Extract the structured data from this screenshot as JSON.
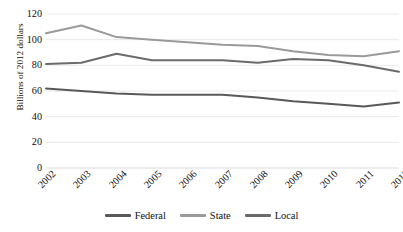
{
  "chart_data": {
    "type": "line",
    "title": "",
    "subtitle": "",
    "xlabel": "",
    "ylabel": "Billions of 2012 dollars",
    "categories": [
      "2002",
      "2003",
      "2004",
      "2005",
      "2006",
      "2007",
      "2008",
      "2009",
      "2010",
      "2011",
      "2012"
    ],
    "x": [
      2002,
      2003,
      2004,
      2005,
      2006,
      2007,
      2008,
      2009,
      2010,
      2011,
      2012
    ],
    "series": [
      {
        "name": "Federal",
        "color": "#595959",
        "values": [
          62,
          60,
          58,
          57,
          57,
          57,
          55,
          52,
          50,
          48,
          51
        ]
      },
      {
        "name": "State",
        "color": "#9a9a9a",
        "values": [
          105,
          111,
          102,
          100,
          98,
          96,
          95,
          91,
          88,
          87,
          91
        ]
      },
      {
        "name": "Local",
        "color": "#6b6b6b",
        "values": [
          81,
          82,
          89,
          84,
          84,
          84,
          82,
          85,
          84,
          80,
          75
        ]
      }
    ],
    "ylim": [
      0,
      120
    ],
    "yticks": [
      0,
      20,
      40,
      60,
      80,
      100,
      120
    ],
    "ytick_labels": [
      "0",
      "20",
      "40",
      "60",
      "80",
      "100",
      "120"
    ],
    "grid": true,
    "grid_axis": "y",
    "legend_position": "bottom",
    "xtick_rotation": -45
  },
  "legend": {
    "items": [
      {
        "label": "Federal",
        "color": "#595959"
      },
      {
        "label": "State",
        "color": "#9a9a9a"
      },
      {
        "label": "Local",
        "color": "#6b6b6b"
      }
    ]
  },
  "axes": {
    "y_title": "Billions of 2012 dollars"
  }
}
